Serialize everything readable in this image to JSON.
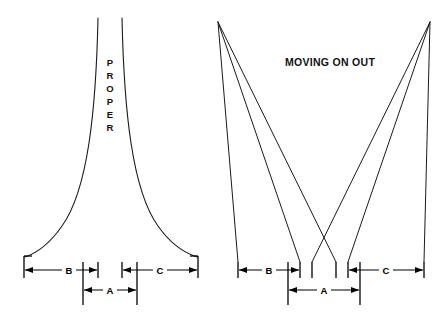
{
  "figure": {
    "background_color": "#ffffff",
    "line_color": "#1a1a1a",
    "annotation_color": "#000000"
  },
  "panels": [
    {
      "id": "left",
      "title": "PROPER",
      "title_orientation": "vertical",
      "title_letters": [
        "P",
        "R",
        "O",
        "P",
        "E",
        "R"
      ],
      "shape_type": "flared-curve-pair",
      "dimensions": [
        {
          "label": "B",
          "row": "upper",
          "x_start": 24,
          "x_end": 98
        },
        {
          "label": "C",
          "row": "upper",
          "x_start": 122,
          "x_end": 198
        },
        {
          "label": "A",
          "row": "lower",
          "x_start": 83,
          "x_end": 137
        }
      ]
    },
    {
      "id": "right",
      "title": "MOVING ON OUT",
      "title_orientation": "horizontal",
      "shape_type": "crossed-ray-fan",
      "dimensions": [
        {
          "label": "B",
          "row": "upper",
          "x_start": 238,
          "x_end": 300
        },
        {
          "label": "C",
          "row": "upper",
          "x_start": 348,
          "x_end": 424
        },
        {
          "label": "A",
          "row": "lower",
          "x_start": 288,
          "x_end": 360
        }
      ]
    }
  ],
  "geometry": {
    "left_panel": {
      "curve_top_y": 18,
      "curve_left_top_x": 98,
      "curve_right_top_x": 122,
      "curve_left_bottom_x": 25,
      "curve_right_bottom_x": 197,
      "curve_bottom_y": 258
    },
    "right_panel": {
      "apex_left": {
        "x": 218,
        "y": 22
      },
      "apex_right": {
        "x": 430,
        "y": 22
      },
      "crossing_point": {
        "x": 324,
        "y": 243
      },
      "baseline_y": 262,
      "baseline_endpoints": [
        238,
        300,
        312,
        336,
        348,
        424
      ]
    },
    "dimension_rows": {
      "upper_y": 270,
      "lower_y": 290,
      "extension_top_y": 256,
      "extension_bottom_y": 305
    }
  }
}
